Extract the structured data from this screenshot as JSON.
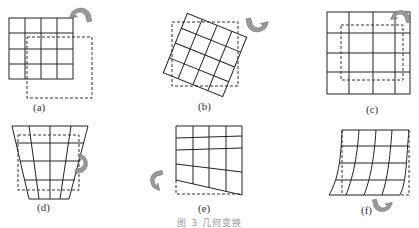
{
  "figure": {
    "panels": [
      {
        "id": "a",
        "label": "(a)",
        "transform": "translation",
        "arrow_icon": "rotate-arrow-icon"
      },
      {
        "id": "b",
        "label": "(b)",
        "transform": "rotation",
        "arrow_icon": "rotate-arrow-icon"
      },
      {
        "id": "c",
        "label": "(c)",
        "transform": "scaling",
        "arrow_icon": "rotate-arrow-icon"
      },
      {
        "id": "d",
        "label": "(d)",
        "transform": "perspective",
        "arrow_icon": "rotate-arrow-icon"
      },
      {
        "id": "e",
        "label": "(e)",
        "transform": "shear/tilt",
        "arrow_icon": "rotate-arrow-icon"
      },
      {
        "id": "f",
        "label": "(f)",
        "transform": "nonlinear warp",
        "arrow_icon": "rotate-arrow-icon"
      }
    ],
    "caption": "图 3  几何变换"
  },
  "colors": {
    "grid_line": "#222222",
    "dashed_line": "#333333",
    "arrow_fill": "#9a9a9a"
  }
}
